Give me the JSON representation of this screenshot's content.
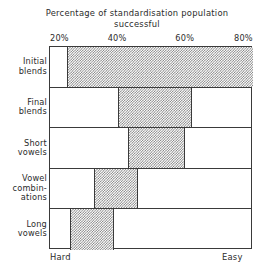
{
  "chart_data": {
    "type": "bar",
    "orientation": "horizontal",
    "title": "Percentage of standardisation population\nsuccessful",
    "xlabel": "",
    "ylabel": "",
    "xlim": [
      20,
      80
    ],
    "grid": false,
    "legend": null,
    "xticks": [
      "20%",
      "40%",
      "60%",
      "80%"
    ],
    "xtick_values": [
      20,
      40,
      60,
      80
    ],
    "categories": [
      "Initial\nblends",
      "Final\nblends",
      "Short\nvowels",
      "Vowel\ncombin-\nations",
      "Long\nvowels"
    ],
    "bars": [
      {
        "category": "Initial blends",
        "start": 25,
        "end": 80
      },
      {
        "category": "Final blends",
        "start": 40,
        "end": 62
      },
      {
        "category": "Short vowels",
        "start": 43,
        "end": 60
      },
      {
        "category": "Vowel combinations",
        "start": 33,
        "end": 46
      },
      {
        "category": "Long vowels",
        "start": 26,
        "end": 39
      }
    ],
    "annotations": {
      "axis_left_end": "Hard",
      "axis_right_end": "Easy"
    },
    "colors": {
      "bar_fill": "#7d7d7d",
      "bar_background": "#ffffff",
      "axis_line": "#3a3a3a",
      "text": "#2b2b2b",
      "plot_background": "#ffffff"
    }
  }
}
